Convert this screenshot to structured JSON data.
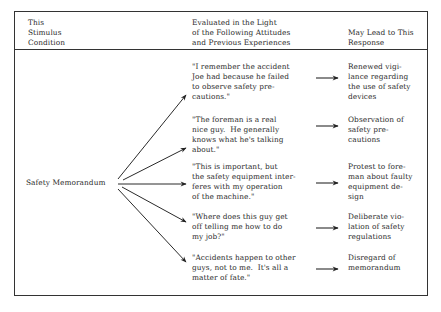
{
  "header": {
    "col1": "This\nStimulus\nCondition",
    "col2": "Evaluated in the Light\nof the Following Attitudes\nand Previous Experiences",
    "col3": "May Lead to This\nResponse"
  },
  "stimulus": "Safety Memorandum",
  "rows": [
    {
      "attitude": "\"I remember the accident\nJoe had because he failed\nto observe safety pre-\ncautions.\"",
      "response": "Renewed vigi-\nlance regarding\nthe use of safety\ndevices"
    },
    {
      "attitude": "\"The foreman is a real\nnice guy.  He generally\nknows what he's talking\nabout.\"",
      "response": "Observation of\nsafety pre-\ncautions"
    },
    {
      "attitude": "\"This is important, but\nthe safety equipment inter-\nferes with my operation\nof the machine.\"",
      "response": "Protest to fore-\nman about faulty\nequipment de-\nsign"
    },
    {
      "attitude": "\"Where does this guy get\noff telling me how to do\nmy job?\"",
      "response": "Deliberate vio-\nlation of safety\nregulations"
    },
    {
      "attitude": "\"Accidents happen to other\nguys, not to me.  It's all a\nmatter of fate.\"",
      "response": "Disregard of\nmemorandum"
    }
  ]
}
